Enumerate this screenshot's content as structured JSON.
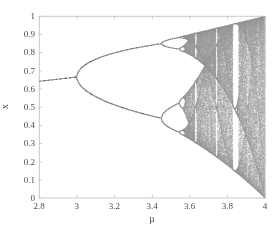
{
  "chart_data": {
    "type": "scatter",
    "title": "",
    "subtitle": "",
    "xlabel": "μ",
    "ylabel": "x",
    "xlim": [
      2.8,
      4.0
    ],
    "ylim": [
      0.0,
      1.0
    ],
    "grid": false,
    "legend": null,
    "x_ticks": [
      2.8,
      3,
      3.2,
      3.4,
      3.6,
      3.8,
      4
    ],
    "x_tick_labels": [
      "2.8",
      "3",
      "3.2",
      "3.4",
      "3.6",
      "3.8",
      "4"
    ],
    "y_ticks": [
      0,
      0.1,
      0.2,
      0.3,
      0.4,
      0.5,
      0.6,
      0.7,
      0.8,
      0.9,
      1
    ],
    "y_tick_labels": [
      "0",
      "0.1",
      "0.2",
      "0.3",
      "0.4",
      "0.5",
      "0.6",
      "0.7",
      "0.8",
      "0.9",
      "1"
    ],
    "map_equation": "x_{n+1} = μ x_n (1 - x_n)",
    "mu_min": 2.8,
    "mu_max": 4.0,
    "mu_steps": 1400,
    "transient_iterations": 300,
    "plotted_iterations": 200,
    "x_initial": 0.35,
    "point_color": "#9a9a9a",
    "point_size": 1,
    "annotations": [
      {
        "label": "period-1 fixed point begins",
        "mu": 2.8,
        "x": 0.643
      },
      {
        "label": "first period-doubling (period-2)",
        "mu": 3.0,
        "x": 0.667
      },
      {
        "label": "period-4 bifurcation",
        "mu": 3.449,
        "x": 0.44
      },
      {
        "label": "period-8 bifurcation",
        "mu": 3.544,
        "x": 0.37
      },
      {
        "label": "onset of chaos (Feigenbaum point)",
        "mu": 3.5699,
        "x": 0.0
      },
      {
        "label": "period-3 window",
        "mu": 3.8284,
        "x": 0.0
      }
    ]
  },
  "axes": {
    "left_px": 39,
    "right_px": 265,
    "top_px": 16,
    "bottom_px": 198,
    "axis_color": "#b8b8b8",
    "tick_color": "#b8b8b8",
    "label_color": "#4a4a4a",
    "background": "#ffffff"
  }
}
